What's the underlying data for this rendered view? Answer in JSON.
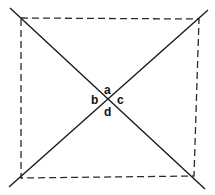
{
  "diagram": {
    "labels": {
      "a": "a",
      "b": "b",
      "c": "c",
      "d": "d"
    },
    "colors": {
      "line": "#1a1a1a",
      "background": "#ffffff"
    }
  }
}
